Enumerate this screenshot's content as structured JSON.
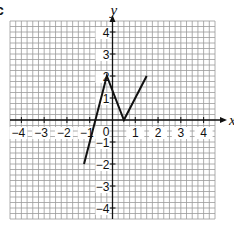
{
  "part_label": "c",
  "chart_data": {
    "type": "line",
    "title": "",
    "xlabel": "x",
    "ylabel": "y",
    "xlim": [
      -4.5,
      4.5
    ],
    "ylim": [
      -4.5,
      4.5
    ],
    "grid": true,
    "minor_divisions_per_unit": 4,
    "x_ticks": [
      -4,
      -3,
      -2,
      -1,
      1,
      2,
      3,
      4
    ],
    "x_tick_labels": [
      "−4",
      "−3",
      "−2",
      "−1",
      "1",
      "2",
      "3",
      "4"
    ],
    "y_ticks": [
      4,
      3,
      2,
      1,
      -1,
      -2,
      -3,
      -4
    ],
    "y_tick_labels": [
      "4",
      "3",
      "2",
      "1",
      "−1",
      "−2",
      "−3",
      "−4"
    ],
    "origin_label": "0",
    "series": [
      {
        "name": "graph",
        "points": [
          [
            -1.25,
            -2
          ],
          [
            -0.25,
            2
          ],
          [
            0.5,
            0
          ],
          [
            1.5,
            2
          ]
        ]
      }
    ]
  },
  "colors": {
    "grid": "#9a9a9a",
    "axis": "#111111",
    "line": "#111111"
  }
}
